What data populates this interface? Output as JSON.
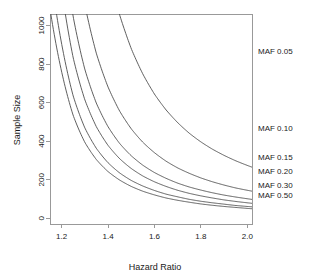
{
  "chart_data": {
    "type": "line",
    "title": "",
    "xlabel": "Hazard Ratio",
    "ylabel": "Sample Size",
    "xlim": [
      1.15,
      2.02
    ],
    "ylim": [
      -30,
      1060
    ],
    "xticks": [
      1.2,
      1.4,
      1.6,
      1.8,
      2.0
    ],
    "xticklabels": [
      "1.2",
      "1.4",
      "1.6",
      "1.8",
      "2.0"
    ],
    "yticks": [
      0,
      200,
      400,
      600,
      800,
      1000
    ],
    "yticklabels": [
      "0",
      "200",
      "400",
      "600",
      "800",
      "1000"
    ],
    "grid": false,
    "legend_position": "right-inline",
    "x": [
      1.2,
      1.25,
      1.3,
      1.35,
      1.4,
      1.45,
      1.5,
      1.55,
      1.6,
      1.65,
      1.7,
      1.75,
      1.8,
      1.85,
      1.9,
      1.95,
      2.0
    ],
    "series": [
      {
        "name": "MAF 0.05",
        "label": "MAF 0.05",
        "values": [
          4060,
          2840,
          2100,
          1620,
          1290,
          1055,
          880,
          748,
          644,
          562,
          496,
          441,
          396,
          358,
          326,
          298,
          274
        ]
      },
      {
        "name": "MAF 0.10",
        "label": "MAF 0.10",
        "values": [
          2140,
          1498,
          1108,
          854,
          681,
          556,
          464,
          394,
          340,
          296,
          261,
          233,
          209,
          189,
          172,
          157,
          145
        ]
      },
      {
        "name": "MAF 0.15",
        "label": "MAF 0.15",
        "values": [
          1493,
          1045,
          773,
          596,
          475,
          388,
          324,
          275,
          237,
          207,
          182,
          162,
          146,
          132,
          120,
          110,
          101
        ]
      },
      {
        "name": "MAF 0.20",
        "label": "MAF 0.20",
        "values": [
          1189,
          832,
          615,
          474,
          378,
          309,
          258,
          219,
          189,
          165,
          145,
          129,
          116,
          105,
          95,
          87,
          80
        ]
      },
      {
        "name": "MAF 0.30",
        "label": "MAF 0.30",
        "values": [
          906,
          634,
          469,
          362,
          288,
          235,
          196,
          167,
          144,
          125,
          111,
          98,
          88,
          80,
          73,
          66,
          61
        ]
      },
      {
        "name": "MAF 0.50",
        "label": "MAF 0.50",
        "values": [
          761,
          533,
          394,
          304,
          242,
          198,
          165,
          140,
          121,
          105,
          93,
          83,
          74,
          67,
          61,
          56,
          51
        ]
      }
    ],
    "curve_labels": [
      {
        "text": "MAF 0.05",
        "y_px": 54
      },
      {
        "text": "MAF 0.10",
        "y_px": 131
      },
      {
        "text": "MAF 0.15",
        "y_px": 160
      },
      {
        "text": "MAF 0.20",
        "y_px": 174
      },
      {
        "text": "MAF 0.30",
        "y_px": 188
      },
      {
        "text": "MAF 0.50",
        "y_px": 198
      }
    ],
    "colors": {
      "curve": "#4d4d4d",
      "axis": "#999999",
      "text": "#1a1a1a",
      "background": "#ffffff"
    }
  }
}
